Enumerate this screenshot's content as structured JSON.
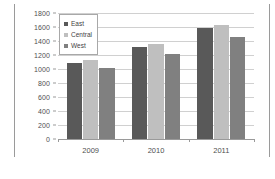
{
  "chart_data": {
    "type": "bar",
    "title": "",
    "xlabel": "",
    "ylabel": "",
    "categories": [
      "2009",
      "2010",
      "2011"
    ],
    "series": [
      {
        "name": "East",
        "color": "#595959",
        "values": [
          1090,
          1320,
          1580
        ]
      },
      {
        "name": "Central",
        "color": "#bfbfbf",
        "values": [
          1130,
          1360,
          1630
        ]
      },
      {
        "name": "West",
        "color": "#808080",
        "values": [
          1010,
          1220,
          1460
        ]
      }
    ],
    "ylim": [
      0,
      1800
    ],
    "ytick_step": 200,
    "yticks": [
      0,
      200,
      400,
      600,
      800,
      1000,
      1200,
      1400,
      1600,
      1800
    ],
    "ytick_labels": [
      "0",
      "200",
      "400",
      "600",
      "800",
      "1000",
      "1200",
      "1400",
      "1600",
      "1800"
    ],
    "grid": true,
    "legend_position": "top-left",
    "legend_entries": [
      "East",
      "Central",
      "West"
    ]
  }
}
